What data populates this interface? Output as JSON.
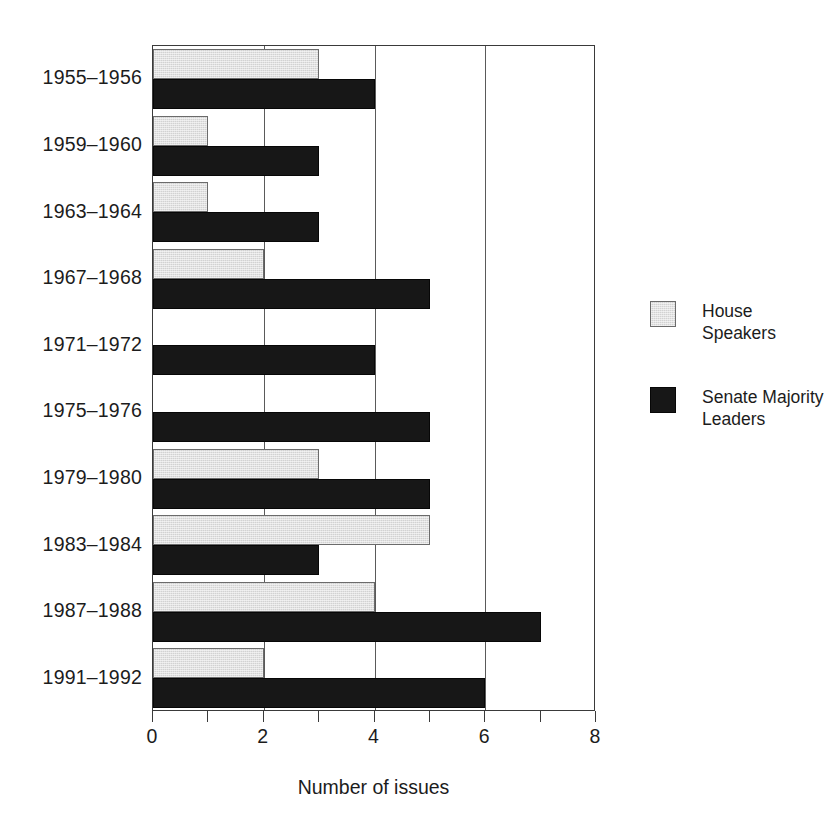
{
  "figure": {
    "bleed_text": "",
    "xaxis_title": "Number of issues"
  },
  "legend": {
    "items": [
      {
        "name": "house-speakers",
        "label": "House Speakers",
        "color": "#d2d2d2"
      },
      {
        "name": "senate-majority-leaders",
        "label": "Senate Majority\nLeaders",
        "color": "#171717"
      }
    ]
  },
  "chart_data": {
    "type": "bar",
    "orientation": "horizontal",
    "title": "",
    "subtitle": "",
    "xlabel": "Number of issues",
    "ylabel": "",
    "xlim": [
      0,
      8
    ],
    "xticks": [
      0,
      1,
      2,
      3,
      4,
      5,
      6,
      7,
      8
    ],
    "xticklabels": [
      "0",
      "",
      "2",
      "",
      "4",
      "",
      "6",
      "",
      "8"
    ],
    "grid": "vertical gridlines at 2, 4, 6",
    "gridlines": [
      2,
      4,
      6
    ],
    "legend_position": "right",
    "categories": [
      "1955–1956",
      "1959–1960",
      "1963–1964",
      "1967–1968",
      "1971–1972",
      "1975–1976",
      "1979–1980",
      "1983–1984",
      "1987–1988",
      "1991–1992"
    ],
    "series": [
      {
        "name": "House Speakers",
        "color": "#d2d2d2",
        "values": [
          3,
          1,
          1,
          2,
          0,
          0,
          3,
          5,
          4,
          2
        ]
      },
      {
        "name": "Senate Majority Leaders",
        "color": "#171717",
        "values": [
          4,
          3,
          3,
          5,
          4,
          5,
          5,
          3,
          7,
          6
        ]
      }
    ]
  }
}
